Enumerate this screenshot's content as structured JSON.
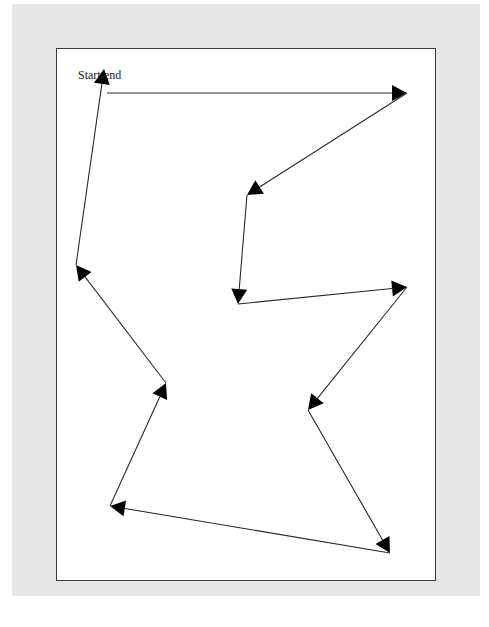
{
  "diagram": {
    "type": "route-tour",
    "label": "Start/end",
    "label_position": {
      "x": 78,
      "y": 68
    },
    "colors": {
      "background": "#e7e7e7",
      "frame_fill": "#ffffff",
      "frame_border": "#3a3a3a",
      "line": "#2a2a2a",
      "arrowhead": "#000000"
    },
    "frame": {
      "x": 56,
      "y": 48,
      "width": 380,
      "height": 533
    },
    "points": [
      {
        "id": "p0",
        "x": 107,
        "y": 93
      },
      {
        "id": "p1",
        "x": 407,
        "y": 93
      },
      {
        "id": "p2",
        "x": 247,
        "y": 195
      },
      {
        "id": "p3",
        "x": 238,
        "y": 304
      },
      {
        "id": "p4",
        "x": 407,
        "y": 287
      },
      {
        "id": "p5",
        "x": 308,
        "y": 410
      },
      {
        "id": "p6",
        "x": 390,
        "y": 553
      },
      {
        "id": "p7",
        "x": 110,
        "y": 506
      },
      {
        "id": "p8",
        "x": 166,
        "y": 383
      },
      {
        "id": "p9",
        "x": 76,
        "y": 265
      },
      {
        "id": "p10",
        "x": 104,
        "y": 69
      }
    ],
    "edges": [
      {
        "from": "p0",
        "to": "p1"
      },
      {
        "from": "p1",
        "to": "p2"
      },
      {
        "from": "p2",
        "to": "p3"
      },
      {
        "from": "p3",
        "to": "p4"
      },
      {
        "from": "p4",
        "to": "p5"
      },
      {
        "from": "p5",
        "to": "p6"
      },
      {
        "from": "p6",
        "to": "p7"
      },
      {
        "from": "p7",
        "to": "p8"
      },
      {
        "from": "p8",
        "to": "p9"
      },
      {
        "from": "p9",
        "to": "p10"
      }
    ]
  }
}
